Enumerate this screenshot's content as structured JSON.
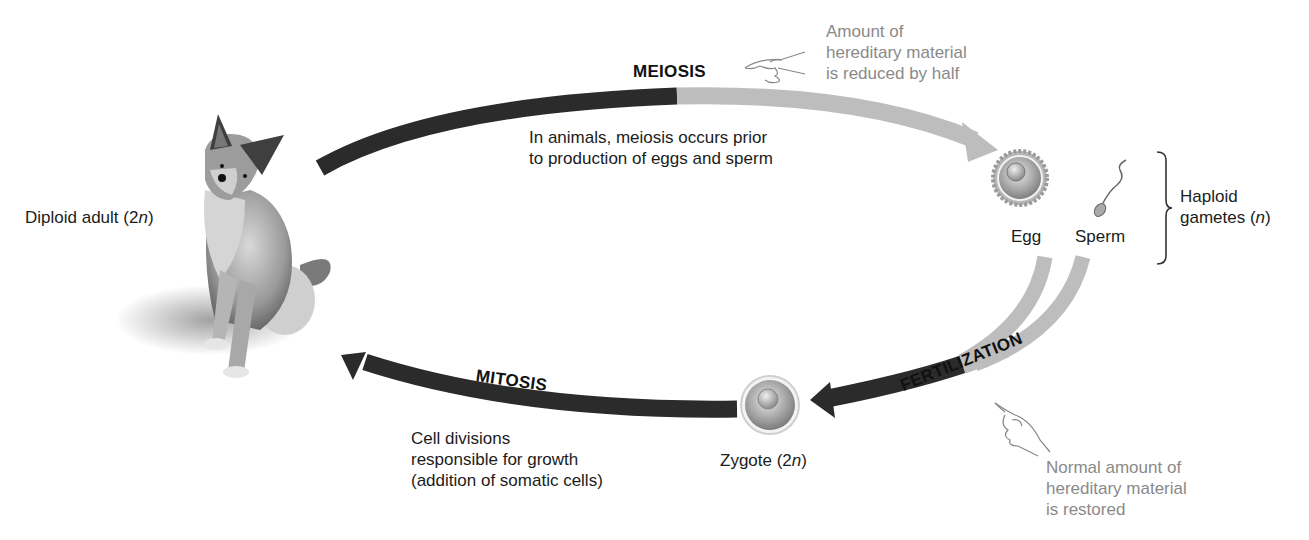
{
  "diagram": {
    "type": "life-cycle",
    "colors": {
      "diploid_arrow": "#2b2b2b",
      "haploid_arrow": "#bdbdbd",
      "note_text": "#8a8a8a",
      "label_text": "#1c1c1c"
    },
    "adult": {
      "label_prefix": "Diploid adult (2",
      "label_italic": "n",
      "label_suffix": ")"
    },
    "meiosis": {
      "title": "MEIOSIS",
      "description_lines": [
        "In animals, meiosis occurs prior",
        "to production of eggs and sperm"
      ],
      "note_lines": [
        "Amount of",
        "hereditary material",
        "is reduced by half"
      ],
      "note_icon": "pointing-hand-icon"
    },
    "gametes": {
      "egg_label": "Egg",
      "sperm_label": "Sperm",
      "group_label_line1": "Haploid",
      "group_label_line2_prefix": "gametes (",
      "group_label_line2_italic": "n",
      "group_label_line2_suffix": ")"
    },
    "fertilization": {
      "title": "FERTILIZATION",
      "note_lines": [
        "Normal amount of",
        "hereditary material",
        "is restored"
      ],
      "note_icon": "pointing-hand-icon"
    },
    "zygote": {
      "label_prefix": "Zygote (2",
      "label_italic": "n",
      "label_suffix": ")"
    },
    "mitosis": {
      "title": "MITOSIS",
      "description_lines": [
        "Cell divisions",
        "responsible for growth",
        "(addition of somatic cells)"
      ]
    }
  }
}
